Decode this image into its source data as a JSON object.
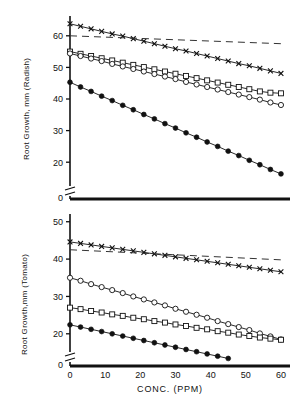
{
  "figure": {
    "background_color": "#ffffff",
    "ink_color": "#111111",
    "xlabel": "CONC.  (PPM)"
  },
  "chart_data": [
    {
      "type": "line",
      "panel": "top",
      "title": "",
      "xlabel": "CONC.  (PPM)",
      "ylabel": "Root Growth, mm (Radish)",
      "xlim": [
        0,
        62
      ],
      "ylim": [
        15,
        65
      ],
      "xticks": [
        0,
        10,
        20,
        30,
        40,
        50,
        60
      ],
      "yticks": [
        20,
        30,
        40,
        50,
        60
      ],
      "ytick_labels": [
        "20",
        "30",
        "40",
        "50",
        "60"
      ],
      "axis_break": true,
      "axis_break_label": "0",
      "grid": false,
      "legend": "none",
      "series": [
        {
          "name": "series-x-marker",
          "marker": "x",
          "x": [
            0,
            3,
            6,
            9,
            12,
            15,
            18,
            21,
            24,
            27,
            30,
            33,
            36,
            39,
            42,
            45,
            48,
            51,
            54,
            57,
            60
          ],
          "y": [
            63.8,
            63.0,
            62.2,
            61.4,
            60.6,
            59.9,
            59.1,
            58.3,
            57.5,
            56.7,
            55.9,
            55.2,
            54.4,
            53.6,
            52.8,
            52.0,
            51.2,
            50.5,
            49.7,
            48.9,
            48.1
          ]
        },
        {
          "name": "series-open-square",
          "marker": "square",
          "x": [
            0,
            3,
            6,
            9,
            12,
            15,
            18,
            21,
            24,
            27,
            30,
            33,
            36,
            39,
            42,
            45,
            48,
            51,
            54,
            57,
            60
          ],
          "y": [
            55.0,
            54.3,
            53.6,
            52.9,
            52.2,
            51.5,
            50.8,
            50.1,
            49.4,
            48.7,
            48.0,
            47.3,
            46.6,
            45.9,
            45.2,
            44.5,
            43.8,
            43.1,
            42.4,
            42.0,
            41.8
          ]
        },
        {
          "name": "series-open-circle",
          "marker": "circle",
          "x": [
            0,
            3,
            6,
            9,
            12,
            15,
            18,
            21,
            24,
            27,
            30,
            33,
            36,
            39,
            42,
            45,
            48,
            51,
            54,
            57,
            60
          ],
          "y": [
            54.4,
            53.6,
            52.8,
            52.0,
            51.1,
            50.3,
            49.5,
            48.7,
            47.9,
            47.1,
            46.3,
            45.4,
            44.6,
            43.8,
            43.0,
            42.2,
            41.4,
            40.6,
            39.8,
            38.9,
            38.1
          ]
        },
        {
          "name": "series-filled-circle",
          "marker": "filled-circle",
          "x": [
            0,
            3,
            6,
            9,
            12,
            15,
            18,
            21,
            24,
            27,
            30,
            33,
            36,
            39,
            42,
            45,
            48,
            51,
            54,
            57,
            60
          ],
          "y": [
            45.3,
            43.8,
            42.4,
            40.9,
            39.5,
            38.0,
            36.6,
            35.1,
            33.7,
            32.2,
            30.8,
            29.3,
            27.9,
            26.4,
            25.0,
            23.5,
            22.1,
            20.6,
            19.2,
            17.7,
            16.3
          ]
        },
        {
          "name": "reference-dashed-line",
          "marker": "none",
          "style": "dashed",
          "x": [
            0,
            60
          ],
          "y": [
            60.0,
            57.5
          ]
        }
      ]
    },
    {
      "type": "line",
      "panel": "bottom",
      "title": "",
      "xlabel": "CONC.  (PPM)",
      "ylabel": "Root Growth,mm (Tomato)",
      "xlim": [
        0,
        62
      ],
      "ylim": [
        17,
        51
      ],
      "xticks": [
        0,
        10,
        20,
        30,
        40,
        50,
        60
      ],
      "xtick_labels": [
        "0",
        "10",
        "20",
        "30",
        "40",
        "50",
        "60"
      ],
      "yticks": [
        20,
        30,
        40,
        50
      ],
      "ytick_labels": [
        "20",
        "30",
        "40",
        "50"
      ],
      "axis_break": true,
      "axis_break_label": "0",
      "grid": false,
      "legend": "none",
      "series": [
        {
          "name": "series-x-marker",
          "marker": "x",
          "x": [
            0,
            3,
            6,
            9,
            12,
            15,
            18,
            21,
            24,
            27,
            30,
            33,
            36,
            39,
            42,
            45,
            48,
            51,
            54,
            57,
            60
          ],
          "y": [
            44.6,
            44.2,
            43.8,
            43.4,
            43.0,
            42.6,
            42.2,
            41.8,
            41.4,
            41.0,
            40.6,
            40.2,
            39.8,
            39.4,
            39.0,
            38.6,
            38.2,
            37.8,
            37.4,
            37.0,
            36.6
          ]
        },
        {
          "name": "series-open-circle",
          "marker": "circle",
          "x": [
            0,
            3,
            6,
            9,
            12,
            15,
            18,
            21,
            24,
            27,
            30,
            33,
            36,
            39,
            42,
            45,
            48,
            51,
            54,
            57,
            60
          ],
          "y": [
            35.0,
            34.2,
            33.3,
            32.5,
            31.7,
            30.9,
            30.0,
            29.2,
            28.4,
            27.6,
            26.7,
            25.9,
            25.1,
            24.3,
            23.4,
            22.6,
            21.8,
            21.0,
            20.1,
            19.3,
            18.5
          ]
        },
        {
          "name": "series-open-square",
          "marker": "square",
          "x": [
            0,
            3,
            6,
            9,
            12,
            15,
            18,
            21,
            24,
            27,
            30,
            33,
            36,
            39,
            42,
            45,
            48,
            51,
            54,
            57,
            60
          ],
          "y": [
            27.0,
            26.6,
            26.1,
            25.7,
            25.2,
            24.8,
            24.3,
            23.9,
            23.4,
            23.0,
            22.5,
            22.1,
            21.6,
            21.2,
            20.7,
            20.3,
            19.8,
            19.4,
            19.0,
            18.7,
            18.4
          ]
        },
        {
          "name": "series-filled-circle",
          "marker": "filled-circle",
          "x": [
            0,
            3,
            6,
            9,
            12,
            15,
            18,
            21,
            24,
            27,
            30,
            33,
            36,
            39,
            42,
            45
          ],
          "y": [
            22.4,
            21.8,
            21.2,
            20.6,
            20.0,
            19.4,
            18.8,
            18.2,
            17.6,
            17.0,
            16.4,
            15.8,
            15.2,
            14.6,
            14.0,
            13.4
          ]
        },
        {
          "name": "reference-dashed-line",
          "marker": "none",
          "style": "dashed",
          "x": [
            0,
            60
          ],
          "y": [
            42.5,
            39.8
          ]
        }
      ]
    }
  ]
}
